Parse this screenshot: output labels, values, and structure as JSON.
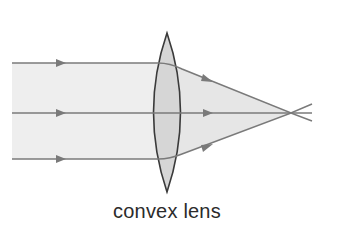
{
  "diagram": {
    "type": "optics-ray-diagram",
    "label": "convex lens",
    "colors": {
      "ray": "#7a7a7a",
      "beam_fill": "#ededed",
      "lens_fill": "#d6d6d6",
      "lens_outline": "#3a3a3a",
      "label": "#2b2b2b"
    },
    "rays": [
      {
        "name": "top-ray",
        "y_in": 63
      },
      {
        "name": "middle-ray",
        "y_in": 113
      },
      {
        "name": "bottom-ray",
        "y_in": 159
      }
    ],
    "lens": {
      "center_x": 167,
      "top_y": 33,
      "bottom_y": 192
    },
    "focal_point": {
      "x": 291,
      "y": 113
    }
  }
}
